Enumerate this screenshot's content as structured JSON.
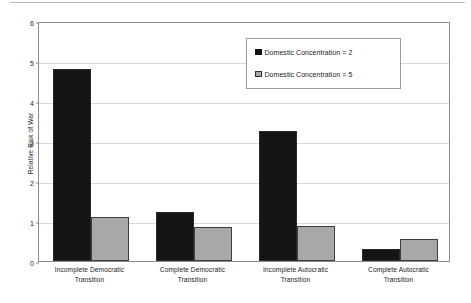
{
  "chart_data": {
    "type": "bar",
    "title": "",
    "xlabel": "",
    "ylabel": "Relative Risk of War",
    "ylim": [
      0,
      6
    ],
    "ytick_labels": [
      "0",
      "1",
      "2",
      "3",
      "4",
      "5",
      "6"
    ],
    "ytick_values": [
      0,
      1,
      2,
      3,
      4,
      5,
      6
    ],
    "grid": true,
    "legend_position": "upper right",
    "categories": [
      "Incomplete Democratic Transition",
      "Complete Democratic Transition",
      "Incomplete Autocratic Transition",
      "Complete Autocratic Transition"
    ],
    "category_lines": [
      [
        "Incomplete Democratic",
        "Transition"
      ],
      [
        "Complete Democratic",
        "Transition"
      ],
      [
        "Incomplete Autocratic",
        "Transition"
      ],
      [
        "Complete Autocratic",
        "Transition"
      ]
    ],
    "series": [
      {
        "name": "Domestic Concentration = 2",
        "color": "#141414",
        "values": [
          4.8,
          1.22,
          3.25,
          0.3
        ]
      },
      {
        "name": "Domestic Concentration = 5",
        "color": "#a8a8a8",
        "values": [
          1.1,
          0.85,
          0.87,
          0.55
        ]
      }
    ]
  },
  "legend": {
    "items": [
      {
        "label": "Domestic Concentration = 2",
        "swatch": "black-square-icon"
      },
      {
        "label": "Domestic Concentration = 5",
        "swatch": "gray-square-icon"
      }
    ]
  },
  "axes": {
    "y_title": "Relative Risk of War"
  }
}
